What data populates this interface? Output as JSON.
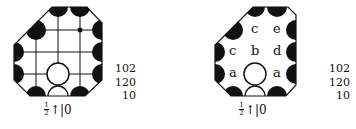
{
  "diagrams": [
    {
      "id": "left",
      "scores": [
        "102",
        "120",
        "10"
      ],
      "caption": {
        "frac_num": "1",
        "frac_den": "2",
        "rest": "↑|0"
      },
      "labels": []
    },
    {
      "id": "right",
      "scores": [
        "102",
        "120",
        "10"
      ],
      "caption": {
        "frac_num": "1",
        "frac_den": "2",
        "rest": "↑|0"
      },
      "labels": [
        {
          "text": "c",
          "col": 1,
          "row": 0
        },
        {
          "text": "e",
          "col": 2,
          "row": 0
        },
        {
          "text": "c",
          "col": 0,
          "row": 1
        },
        {
          "text": "b",
          "col": 1,
          "row": 1
        },
        {
          "text": "d",
          "col": 2,
          "row": 1
        },
        {
          "text": "a",
          "col": 0,
          "row": 2
        },
        {
          "text": "a",
          "col": 2,
          "row": 2
        }
      ]
    }
  ],
  "colors": {
    "ink": "#111111",
    "paper": "#ffffff"
  }
}
